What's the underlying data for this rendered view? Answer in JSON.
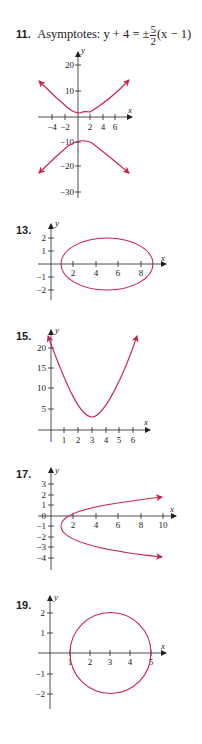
{
  "problems": [
    {
      "number": "11.",
      "caption_prefix": "Asymptotes:",
      "caption_lhs": "y + 4 = ±",
      "caption_frac_num": "5",
      "caption_frac_den": "2",
      "caption_rhs": "(x − 1)",
      "x_label": "x",
      "y_label": "y",
      "x_ticks": [
        "−4",
        "−2",
        "2",
        "4",
        "6"
      ],
      "y_ticks": [
        "20",
        "10",
        "−10",
        "−20",
        "−30"
      ]
    },
    {
      "number": "13.",
      "x_label": "x",
      "y_label": "y",
      "x_ticks": [
        "2",
        "4",
        "6",
        "8"
      ],
      "y_ticks": [
        "2",
        "1",
        "−1",
        "−2"
      ]
    },
    {
      "number": "15.",
      "x_label": "x",
      "y_label": "y",
      "x_ticks": [
        "1",
        "2",
        "3",
        "4",
        "5",
        "6"
      ],
      "y_ticks": [
        "20",
        "15",
        "10",
        "5"
      ]
    },
    {
      "number": "17.",
      "x_label": "x",
      "y_label": "y",
      "x_ticks": [
        "2",
        "4",
        "6",
        "8",
        "10"
      ],
      "y_ticks": [
        "3",
        "2",
        "1",
        "0",
        "−1",
        "−2",
        "−3",
        "−4"
      ]
    },
    {
      "number": "19.",
      "x_label": "x",
      "y_label": "y",
      "x_ticks": [
        "1",
        "2",
        "3",
        "4",
        "5"
      ],
      "y_ticks": [
        "2",
        "1",
        "−1",
        "−2"
      ]
    }
  ],
  "colors": {
    "curve": "#c8234a",
    "axis": "#222222"
  }
}
